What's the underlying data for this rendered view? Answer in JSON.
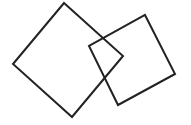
{
  "diagram": {
    "background": "#ffffff",
    "stroke_color": "#222222",
    "stroke_width": 2,
    "shapes": [
      {
        "name": "left-square",
        "type": "square",
        "points": "64,3 123,56 72,117 13,64"
      },
      {
        "name": "right-square",
        "type": "square",
        "points": "145,15 175,74 118,105 89,46"
      }
    ]
  }
}
